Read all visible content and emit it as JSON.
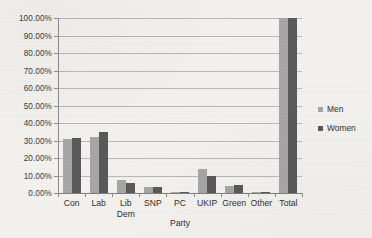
{
  "chart_data": {
    "type": "bar",
    "title": "",
    "xlabel": "Party",
    "ylabel": "",
    "ylim": [
      0,
      100
    ],
    "grid": true,
    "legend_position": "right",
    "categories": [
      "Con",
      "Lab",
      "Lib Dem",
      "SNP",
      "PC",
      "UKIP",
      "Green",
      "Other",
      "Total"
    ],
    "category_labels": [
      "Con",
      "Lab",
      "Lib\nDem",
      "SNP",
      "PC",
      "UKIP",
      "Green",
      "Other",
      "Total"
    ],
    "series": [
      {
        "name": "Men",
        "color": "#a6a6a6",
        "values": [
          31.0,
          32.0,
          7.7,
          3.5,
          0.3,
          13.5,
          4.1,
          0.4,
          100.0
        ]
      },
      {
        "name": "Women",
        "color": "#595959",
        "values": [
          31.2,
          34.6,
          5.8,
          3.2,
          0.3,
          10.0,
          4.8,
          0.4,
          100.0
        ]
      }
    ],
    "ytick_values": [
      0,
      10,
      20,
      30,
      40,
      50,
      60,
      70,
      80,
      90,
      100
    ],
    "ytick_labels": [
      "0.00%",
      "10.00%",
      "20.00%",
      "30.00%",
      "40.00%",
      "50.00%",
      "60.00%",
      "70.00%",
      "80.00%",
      "90.00%",
      "100.00%"
    ]
  },
  "legend": {
    "items": [
      {
        "label": "Men",
        "marker": "legend-swatch-men"
      },
      {
        "label": "Women",
        "marker": "legend-swatch-women"
      }
    ]
  },
  "colors": {
    "men": "#a6a6a6",
    "women": "#595959",
    "gridline": "#b8b8b8",
    "axis": "#8c8c8c",
    "background": "#f2f1ee",
    "text": "#2f2f2f"
  }
}
